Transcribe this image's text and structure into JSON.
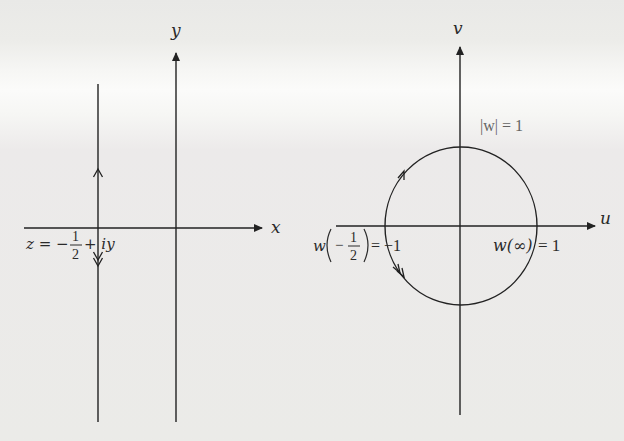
{
  "figure": {
    "left_panel": {
      "name": "z-plane",
      "x_axis_label": "x",
      "y_axis_label": "y",
      "line_label": {
        "prefix": "z = −",
        "frac_num": "1",
        "frac_den": "2",
        "suffix": "+ iy"
      },
      "line": {
        "x_value": -0.5,
        "direction": "downward",
        "arrows": [
          "up-arrow at top",
          "double down-arrow below x-axis"
        ]
      }
    },
    "right_panel": {
      "name": "w-plane",
      "u_axis_label": "u",
      "v_axis_label": "v",
      "circle_label": "|w| = 1",
      "point_left_label": {
        "func": "w",
        "frac_num": "1",
        "frac_den": "2",
        "sign": "−",
        "equals": "= −1"
      },
      "point_right_label": {
        "func": "w(∞)",
        "equals": "= 1"
      },
      "circle": {
        "center": [
          0,
          0
        ],
        "radius": 1,
        "orientation": "counterclockwise arrow upper-left, clockwise-down arrow lower-left"
      }
    }
  },
  "colors": {
    "ink": "#2a2a2a",
    "paper": "#ecece9"
  }
}
